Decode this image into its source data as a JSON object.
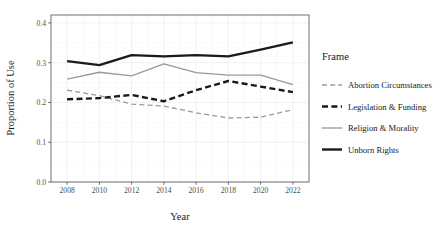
{
  "chart_data": {
    "type": "line",
    "title": "",
    "xlabel": "Year",
    "ylabel": "Proportion of Use",
    "x": [
      2008,
      2010,
      2012,
      2014,
      2016,
      2018,
      2020,
      2022
    ],
    "xtick_labels": [
      "2008",
      "2010",
      "2012",
      "2014",
      "2016",
      "2018",
      "2020",
      "2022"
    ],
    "ytick_labels": [
      "0.0",
      "0.1",
      "0.2",
      "0.3",
      "0.4"
    ],
    "ytick_values": [
      0.0,
      0.1,
      0.2,
      0.3,
      0.4
    ],
    "xlim": [
      2007,
      2023
    ],
    "ylim": [
      0.0,
      0.42
    ],
    "grid": true,
    "legend_position": "right",
    "legend_title": "Frame",
    "series": [
      {
        "name": "Abortion Circumstances",
        "values": [
          0.231,
          0.217,
          0.196,
          0.191,
          0.174,
          0.161,
          0.163,
          0.182
        ],
        "color": "#999999",
        "style": "dashed",
        "width": 1.3
      },
      {
        "name": "Legislation & Funding",
        "values": [
          0.208,
          0.211,
          0.219,
          0.203,
          0.231,
          0.254,
          0.24,
          0.226
        ],
        "color": "#1a1a1a",
        "style": "dashed",
        "width": 2.4
      },
      {
        "name": "Religion & Morality",
        "values": [
          0.259,
          0.276,
          0.267,
          0.297,
          0.275,
          0.269,
          0.269,
          0.245
        ],
        "color": "#999999",
        "style": "solid",
        "width": 1.3
      },
      {
        "name": "Unborn Rights",
        "values": [
          0.304,
          0.294,
          0.319,
          0.316,
          0.319,
          0.316,
          0.333,
          0.351
        ],
        "color": "#1a1a1a",
        "style": "solid",
        "width": 2.4
      }
    ]
  },
  "legend": {
    "title": "Frame",
    "entries": [
      {
        "label": "Abortion Circumstances"
      },
      {
        "label": "Legislation & Funding"
      },
      {
        "label": "Religion & Morality"
      },
      {
        "label": "Unborn Rights"
      }
    ]
  },
  "axes": {
    "x_title": "Year",
    "y_title": "Proportion of Use"
  }
}
